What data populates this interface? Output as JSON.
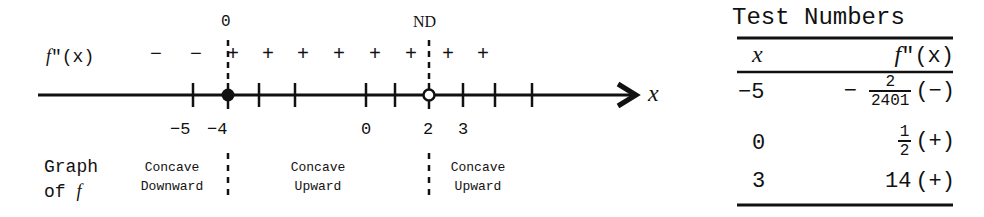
{
  "number_line": {
    "row_label": "f\"(x)",
    "row_label_f": "f",
    "row_label_rest": "\"(x)",
    "axis_label": "x",
    "critical_points": [
      {
        "value": "-4",
        "top_label": "0",
        "marker": "closed-dot"
      },
      {
        "value": "2",
        "top_label": "ND",
        "marker": "open-dot"
      }
    ],
    "signs_left_of_-4": [
      "−",
      "−"
    ],
    "signs_between": [
      "+",
      "+",
      "+",
      "+",
      "+",
      "+"
    ],
    "signs_right_of_2": [
      "+",
      "+"
    ],
    "tick_labels": [
      "−5",
      "−4",
      "0",
      "2",
      "3"
    ],
    "top_labels": {
      "at_minus4": "0",
      "at_2": "ND"
    },
    "graph_label_line1": "Graph",
    "graph_label_line2a": "of ",
    "graph_label_line2b": "f",
    "intervals": [
      {
        "line1": "Concave",
        "line2": "Downward"
      },
      {
        "line1": "Concave",
        "line2": "Upward"
      },
      {
        "line1": "Concave",
        "line2": "Upward"
      }
    ]
  },
  "table": {
    "title": "Test Numbers",
    "headers": {
      "x": "x",
      "fpp_f": "f",
      "fpp_rest": "\"(x)"
    },
    "rows": [
      {
        "x": "−5",
        "prefix": "−",
        "num": "2",
        "den": "2401",
        "sign": "(−)"
      },
      {
        "x": "0",
        "prefix": "",
        "num": "1",
        "den": "2",
        "sign": "(+)"
      },
      {
        "x": "3",
        "value": "14",
        "sign": "(+)"
      }
    ]
  }
}
